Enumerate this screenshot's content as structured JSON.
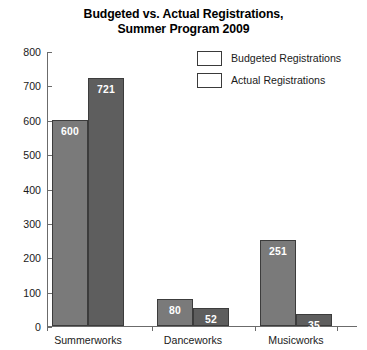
{
  "chart_data": {
    "type": "bar",
    "title": "Budgeted vs. Actual Registrations, Summer Program 2009",
    "title_line1": "Budgeted vs. Actual Registrations,",
    "title_line2": "Summer Program 2009",
    "xlabel": "",
    "ylabel": "",
    "ylim": [
      0,
      800
    ],
    "ytick_step": 100,
    "yticks": [
      "0",
      "100",
      "200",
      "300",
      "400",
      "500",
      "600",
      "700",
      "800"
    ],
    "grid": false,
    "legend_position": "top-right",
    "categories": [
      "Summerworks",
      "Danceworks",
      "Musicworks"
    ],
    "series": [
      {
        "name": "Budgeted Registrations",
        "color": "#7a7a7a",
        "values": [
          600,
          80,
          251
        ],
        "labels": [
          "600",
          "80",
          "251"
        ]
      },
      {
        "name": "Actual Registrations",
        "color": "#5e5e5e",
        "values": [
          721,
          52,
          35
        ],
        "labels": [
          "721",
          "52",
          "35"
        ]
      }
    ]
  }
}
